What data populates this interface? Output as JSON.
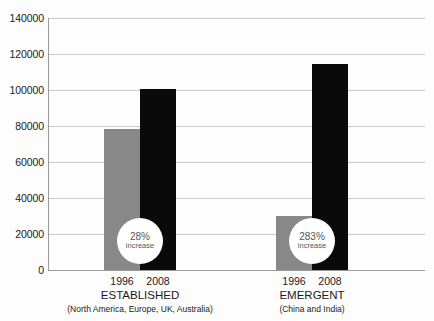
{
  "chart_data": {
    "type": "bar",
    "title": "",
    "xlabel": "",
    "ylabel": "",
    "ylim": [
      0,
      140000
    ],
    "grid": true,
    "legend_position": "none",
    "categories": [
      "1996",
      "2008"
    ],
    "groups": [
      {
        "name": "ESTABLISHED",
        "subtitle": "(North America, Europe, UK, Australia)",
        "values": [
          78500,
          100500
        ],
        "annotation": {
          "percent": "28%",
          "word": "increase"
        }
      },
      {
        "name": "EMERGENT",
        "subtitle": "(China and India)",
        "values": [
          29900,
          114500
        ],
        "annotation": {
          "percent": "283%",
          "word": "increase"
        }
      }
    ],
    "series": [
      {
        "name": "1996",
        "values": [
          78500,
          29900
        ],
        "color": "#888888"
      },
      {
        "name": "2008",
        "values": [
          100500,
          114500
        ],
        "color": "#0a0a0a"
      }
    ],
    "y_ticks": [
      0,
      20000,
      40000,
      60000,
      80000,
      100000,
      120000,
      140000
    ],
    "y_tick_labels": [
      "0",
      "20000",
      "40000",
      "60000",
      "80000",
      "100000",
      "120000",
      "140000"
    ]
  },
  "axis": {
    "gridline_color": "#c9c9c9",
    "axis_color": "#9a9a9a",
    "background": "#fdfdfd"
  }
}
